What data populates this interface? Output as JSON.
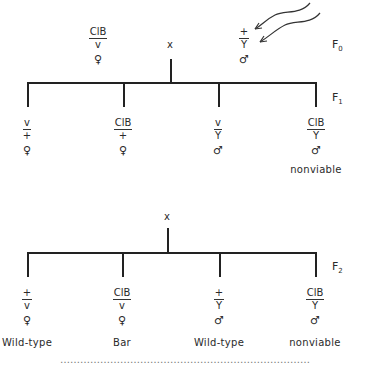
{
  "generations": {
    "f0": {
      "label": "F",
      "sub": "0"
    },
    "f1": {
      "label": "F",
      "sub": "1"
    },
    "f2": {
      "label": "F",
      "sub": "2"
    }
  },
  "cross_symbol": "x",
  "parents": {
    "female": {
      "top": "ClB",
      "bottom": "v",
      "sex": "♀"
    },
    "male": {
      "top": "+",
      "bottom": "Y",
      "sex": "♂",
      "annotation": "irradiation-arrows"
    }
  },
  "f1_offspring": [
    {
      "top": "v",
      "bottom": "+",
      "sex": "♀",
      "note": ""
    },
    {
      "top": "ClB",
      "bottom": "+",
      "sex": "♀",
      "note": ""
    },
    {
      "top": "v",
      "bottom": "Y",
      "sex": "♂",
      "note": ""
    },
    {
      "top": "ClB",
      "bottom": "Y",
      "sex": "♂",
      "note": "nonviable"
    }
  ],
  "f2_offspring": [
    {
      "top": "+",
      "bottom": "v",
      "sex": "♀",
      "phenotype": "Wild-type"
    },
    {
      "top": "ClB",
      "bottom": "v",
      "sex": "♀",
      "phenotype": "Bar"
    },
    {
      "top": "+",
      "bottom": "Y",
      "sex": "♂",
      "phenotype": "Wild-type"
    },
    {
      "top": "ClB",
      "bottom": "Y",
      "sex": "♂",
      "phenotype": "nonviable"
    }
  ],
  "clipped_caption": "…………………………………………………………………"
}
